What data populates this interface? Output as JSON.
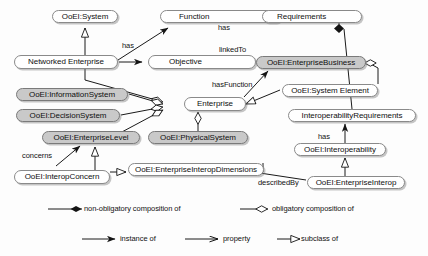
{
  "diagram": {
    "colors": {
      "node_fill_light": "#ffffff",
      "node_fill_gray": "#c9c9c9",
      "stroke": "#8a8a8a",
      "line": "#1a1a1a",
      "background": "#fdfdfd"
    },
    "nodes": [
      {
        "id": "ooei_system",
        "label": "OoEI:System",
        "style": "light",
        "x": 52,
        "y": 10,
        "w": 66,
        "h": 13
      },
      {
        "id": "function",
        "label": "Function",
        "style": "light",
        "x": 160,
        "y": 10,
        "w": 122,
        "h": 13
      },
      {
        "id": "requirements",
        "label": "Requirements",
        "style": "light",
        "x": 262,
        "y": 10,
        "w": 100,
        "h": 13
      },
      {
        "id": "networked_enterprise",
        "label": "Networked Enterprise",
        "style": "light",
        "x": 14,
        "y": 55,
        "w": 104,
        "h": 14
      },
      {
        "id": "objective",
        "label": "Objective",
        "style": "light",
        "x": 148,
        "y": 55,
        "w": 108,
        "h": 14
      },
      {
        "id": "ooei_enterprisebusiness",
        "label": "OoEI:EnterpriseBusiness",
        "style": "gray",
        "x": 256,
        "y": 56,
        "w": 110,
        "h": 13
      },
      {
        "id": "ooei_informationsystem",
        "label": "OoEI:InformationSystem",
        "style": "gray",
        "x": 16,
        "y": 88,
        "w": 112,
        "h": 13
      },
      {
        "id": "ooei_decisionsystem",
        "label": "OoEI:DecisionSystem",
        "style": "gray",
        "x": 16,
        "y": 109,
        "w": 104,
        "h": 13
      },
      {
        "id": "enterprise",
        "label": "Enterprise",
        "style": "light",
        "x": 184,
        "y": 97,
        "w": 62,
        "h": 14
      },
      {
        "id": "ooei_system_element",
        "label": "OoEI:System Element",
        "style": "light",
        "x": 282,
        "y": 84,
        "w": 96,
        "h": 13
      },
      {
        "id": "interop_requirements",
        "label": "InteroperabilityRequirements",
        "style": "light",
        "x": 288,
        "y": 109,
        "w": 128,
        "h": 13
      },
      {
        "id": "ooei_enterpriselevel",
        "label": "OoEI:EnterpriseLevel",
        "style": "gray",
        "x": 42,
        "y": 131,
        "w": 98,
        "h": 13
      },
      {
        "id": "ooei_physicalsystem",
        "label": "OoEI:PhysicalSystem",
        "style": "gray",
        "x": 148,
        "y": 131,
        "w": 100,
        "h": 13
      },
      {
        "id": "ooei_interoperability",
        "label": "OoEI:Interoperability",
        "style": "light",
        "x": 294,
        "y": 143,
        "w": 92,
        "h": 13
      },
      {
        "id": "ooei_interopconcern",
        "label": "OoEI:InteropConcern",
        "style": "light",
        "x": 14,
        "y": 170,
        "w": 96,
        "h": 14
      },
      {
        "id": "ooei_ent_interop_dims",
        "label": "OoEI:EnterpriseInteropDimensions",
        "style": "light",
        "x": 128,
        "y": 163,
        "w": 136,
        "h": 13
      },
      {
        "id": "ooei_enterpriseinterop",
        "label": "OoEI:EnterpriseInterop",
        "style": "light",
        "x": 307,
        "y": 176,
        "w": 98,
        "h": 13
      }
    ],
    "edge_labels": [
      {
        "id": "has_function_objective",
        "text": "has",
        "x": 122,
        "y": 42
      },
      {
        "id": "has_requirements",
        "text": "has",
        "x": 218,
        "y": 24
      },
      {
        "id": "linkedto",
        "text": "linkedTo",
        "x": 219,
        "y": 46
      },
      {
        "id": "hasfunction",
        "text": "hasFunction",
        "x": 212,
        "y": 81
      },
      {
        "id": "has_interop",
        "text": "has",
        "x": 318,
        "y": 133
      },
      {
        "id": "concerns",
        "text": "concerns",
        "x": 22,
        "y": 152
      },
      {
        "id": "describedby",
        "text": "describedBy",
        "x": 258,
        "y": 179
      }
    ],
    "legend": {
      "items": [
        {
          "id": "non-obligatory-composition",
          "label": "non-obligatory composition of",
          "marker": "filled-diamond",
          "x": 40,
          "y": 206,
          "line_w": 38
        },
        {
          "id": "obligatory-composition",
          "label": "obligatory composition of",
          "marker": "hollow-diamond",
          "x": 230,
          "y": 206,
          "line_w": 30
        },
        {
          "id": "instance-of",
          "label": "instance of",
          "marker": "filled-arrow",
          "x": 75,
          "y": 236,
          "line_w": 38
        },
        {
          "id": "property",
          "label": "property",
          "marker": "open-arrow",
          "x": 178,
          "y": 236,
          "line_w": 38
        },
        {
          "id": "subclass-of",
          "label": "subclass of",
          "marker": "hollow-triangle",
          "x": 272,
          "y": 236,
          "line_w": 30
        }
      ]
    }
  }
}
